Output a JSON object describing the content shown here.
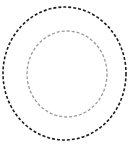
{
  "figure": {
    "title": "",
    "width": 134,
    "height": 147,
    "background_color": "#ffffff"
  },
  "chart_data": {
    "type": "scatter",
    "title": "",
    "subtitle": "",
    "xlabel": "",
    "ylabel": "",
    "xlim": [
      0,
      134
    ],
    "ylim": [
      0,
      147
    ],
    "grid": false,
    "legend": null,
    "axes_visible": false,
    "tick_labels": {
      "x": [],
      "y": []
    },
    "annotations": [],
    "series": [
      {
        "name": "outer-dashed-ellipse",
        "shape": "ellipse",
        "center": [
          64.5,
          73.5
        ],
        "radius_x": 61.5,
        "radius_y": 66.5,
        "stroke_color": "#1c1c1c",
        "stroke_width": 1.6,
        "dash_pattern": [
          3,
          2
        ],
        "fill": "none"
      },
      {
        "name": "inner-dashed-ellipse",
        "shape": "ellipse",
        "center": [
          67,
          74
        ],
        "radius_x": 40,
        "radius_y": 43,
        "stroke_color": "#9a9a9a",
        "stroke_width": 1.3,
        "dash_pattern": [
          3,
          2
        ],
        "fill": "none"
      }
    ]
  }
}
